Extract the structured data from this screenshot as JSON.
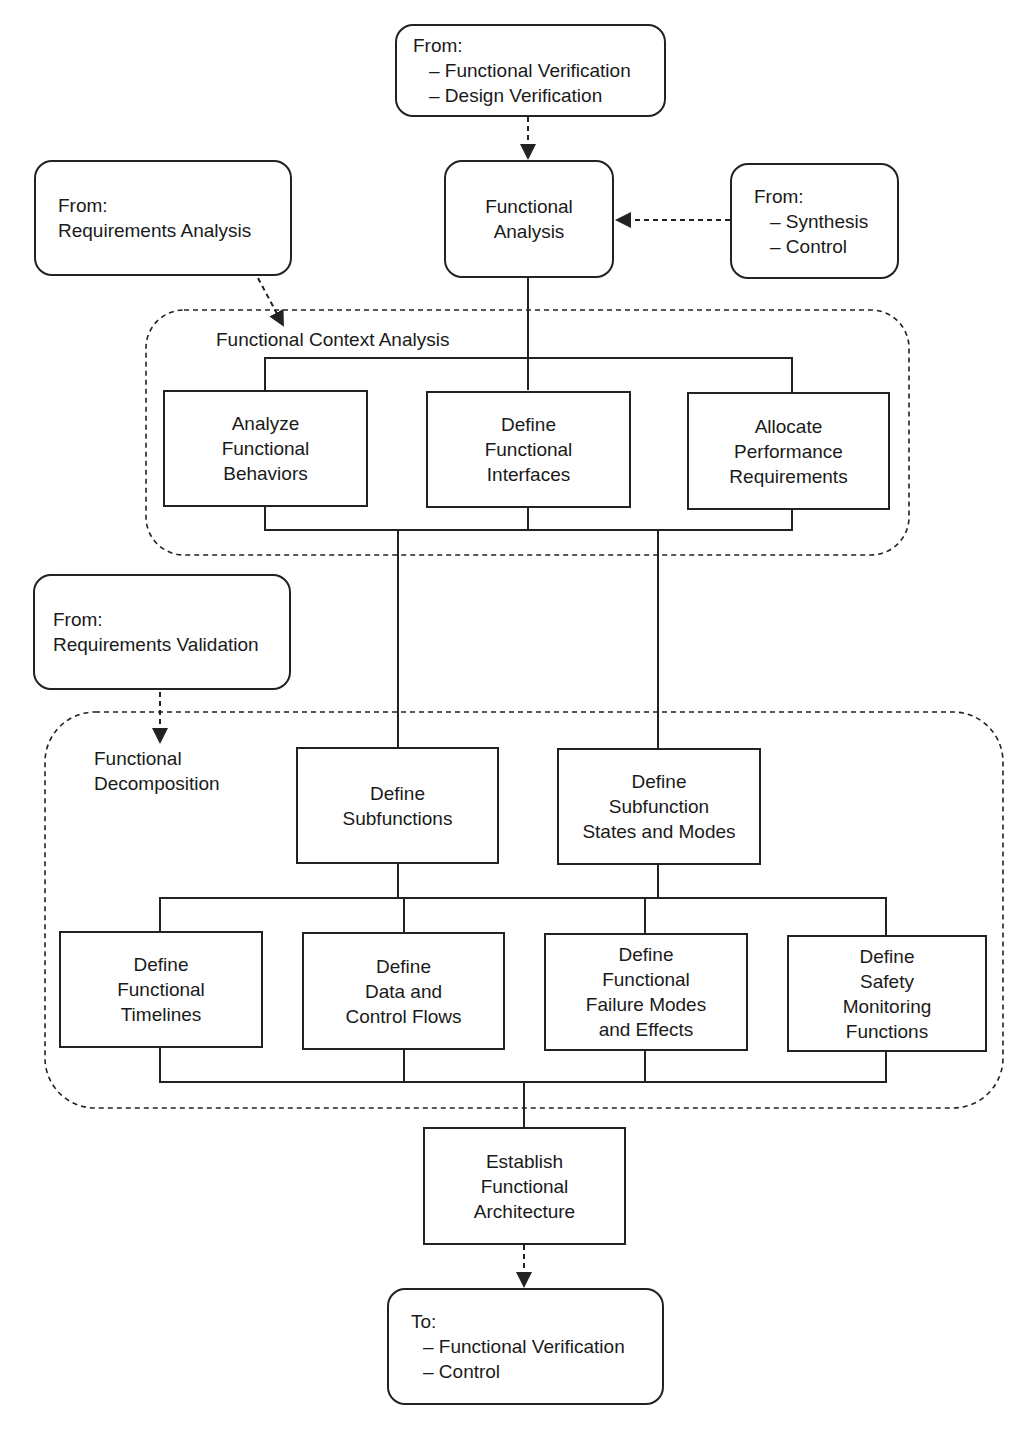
{
  "sources": {
    "top": {
      "heading": "From:",
      "items": [
        "– Functional Verification",
        "– Design Verification"
      ]
    },
    "right": {
      "heading": "From:",
      "items": [
        "– Synthesis",
        "– Control"
      ]
    },
    "req_analysis": {
      "heading": "From:",
      "items": [
        "Requirements Analysis"
      ]
    },
    "req_validation": {
      "heading": "From:",
      "items": [
        "Requirements Validation"
      ]
    }
  },
  "main": {
    "lines": [
      "Functional",
      "Analysis"
    ]
  },
  "context_group": {
    "title": "Functional Context Analysis",
    "boxes": [
      {
        "lines": [
          "Analyze",
          "Functional",
          "Behaviors"
        ]
      },
      {
        "lines": [
          "Define",
          "Functional",
          "Interfaces"
        ]
      },
      {
        "lines": [
          "Allocate",
          "Performance",
          "Requirements"
        ]
      }
    ]
  },
  "decomposition_group": {
    "title_lines": [
      "Functional",
      "Decomposition"
    ],
    "upper_boxes": [
      {
        "lines": [
          "Define",
          "Subfunctions"
        ]
      },
      {
        "lines": [
          "Define",
          "Subfunction",
          "States and Modes"
        ]
      }
    ],
    "lower_boxes": [
      {
        "lines": [
          "Define",
          "Functional",
          "Timelines"
        ]
      },
      {
        "lines": [
          "Define",
          "Data and",
          "Control Flows"
        ]
      },
      {
        "lines": [
          "Define",
          "Functional",
          "Failure Modes",
          "and Effects"
        ]
      },
      {
        "lines": [
          "Define",
          "Safety",
          "Monitoring",
          "Functions"
        ]
      }
    ]
  },
  "architecture": {
    "lines": [
      "Establish",
      "Functional",
      "Architecture"
    ]
  },
  "output": {
    "heading": "To:",
    "items": [
      "– Functional Verification",
      "– Control"
    ]
  }
}
